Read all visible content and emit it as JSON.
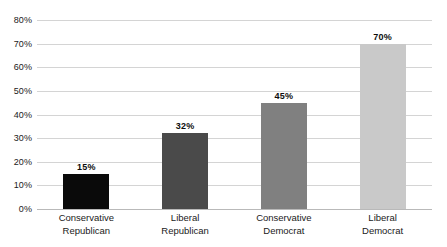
{
  "chart_data": {
    "type": "bar",
    "title": "",
    "xlabel": "",
    "ylabel": "",
    "categories": [
      "Conservative Republican",
      "Liberal Republican",
      "Conservative Democrat",
      "Liberal Democrat"
    ],
    "category_lines": [
      [
        "Conservative",
        "Republican"
      ],
      [
        "Liberal",
        "Republican"
      ],
      [
        "Conservative",
        "Democrat"
      ],
      [
        "Liberal",
        "Democrat"
      ]
    ],
    "values": [
      15,
      32,
      45,
      70
    ],
    "data_labels": [
      "15%",
      "32%",
      "45%",
      "70%"
    ],
    "bar_colors": [
      "#0a0a0a",
      "#4a4a4a",
      "#808080",
      "#c9c9c9"
    ],
    "ylim": [
      0,
      80
    ],
    "ytick_values": [
      0,
      10,
      20,
      30,
      40,
      50,
      60,
      70,
      80
    ],
    "ytick_labels": [
      "0%",
      "10%",
      "20%",
      "30%",
      "40%",
      "50%",
      "60%",
      "70%",
      "80%"
    ],
    "grid": true,
    "grid_color": "#d4d4d4",
    "axis_color": "#b9b9b9",
    "legend": "none",
    "background": "#ffffff"
  }
}
